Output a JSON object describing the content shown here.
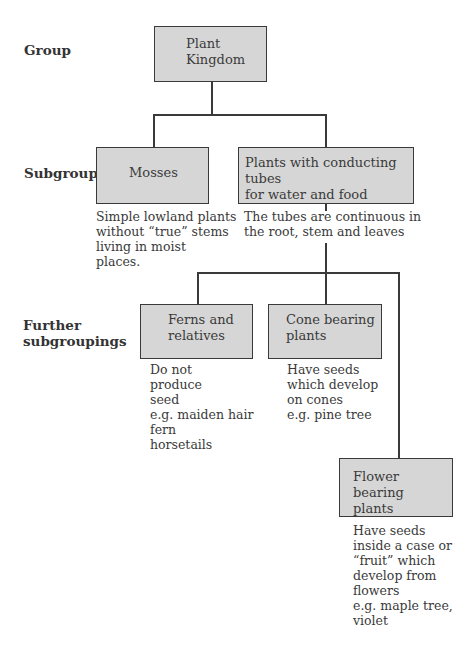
{
  "row_labels": {
    "group": "Group",
    "subgroup": "Subgroup",
    "further": "Further\nsubgroupings"
  },
  "nodes": {
    "plant_kingdom": {
      "title": "Plant\nKingdom"
    },
    "mosses": {
      "title": "Mosses",
      "description": "Simple lowland plants\nwithout “true” stems\nliving in moist\nplaces."
    },
    "conducting": {
      "title": "Plants with conducting tubes\nfor water and food",
      "description": "The tubes are continuous in\nthe root, stem and leaves"
    },
    "ferns": {
      "title": "Ferns and\nrelatives",
      "description": "Do not\nproduce\nseed\ne.g. maiden hair\nfern\nhorsetails"
    },
    "cone": {
      "title": "Cone bearing\nplants",
      "description": "Have seeds\nwhich develop\non cones\ne.g. pine tree"
    },
    "flower": {
      "title": "Flower bearing\nplants",
      "description": "Have seeds\ninside a case or\n“fruit” which\ndevelop from\nflowers\ne.g. maple tree,\nviolet"
    }
  },
  "colors": {
    "box_fill": "#d6d6d6",
    "box_border": "#3a3a3a",
    "line": "#3a3a3a",
    "text": "#3a3a3a"
  }
}
